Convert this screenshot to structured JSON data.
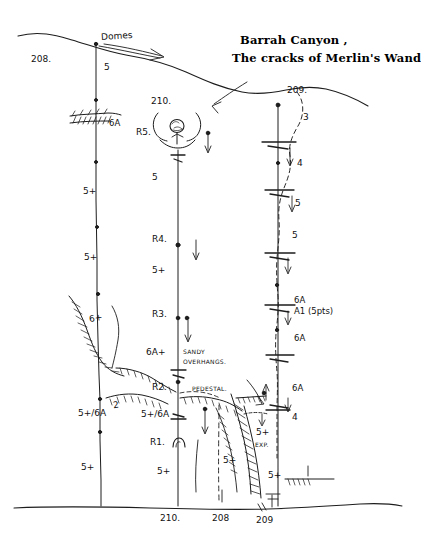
{
  "title": {
    "line1": "Barrah Canyon ,",
    "line2": "The cracks of Merlin's Wand"
  },
  "annotations": {
    "domes": "Domes",
    "sandy_overhangs_l1": "SANDY",
    "sandy_overhangs_l2": "OVERHANGS.",
    "pedestal": "PEDESTAL.",
    "exposed": "EXP.",
    "aid_points": "A1 (5pts)"
  },
  "routes": [
    {
      "id": "route-208",
      "top_label": "208.",
      "bottom_label": "208",
      "belays": [
        {
          "name": "6A-ledge",
          "label": "6A"
        }
      ],
      "pitch_grades": [
        "5",
        "5+",
        "5+",
        "6+",
        "2",
        "5+/6A",
        "5+"
      ]
    },
    {
      "id": "route-210",
      "top_label": "210.",
      "bottom_label": "210.",
      "belays": [
        {
          "name": "R5",
          "label": "R5."
        },
        {
          "name": "R4",
          "label": "R4."
        },
        {
          "name": "R3",
          "label": "R3."
        },
        {
          "name": "R2",
          "label": "R2."
        },
        {
          "name": "R1",
          "label": "R1."
        }
      ],
      "pitch_grades": [
        "5",
        "5+",
        "6A+",
        "5+/6A",
        "5+"
      ]
    },
    {
      "id": "route-209",
      "top_label": "209.",
      "bottom_label": "209",
      "pitch_grades": [
        "3",
        "4",
        "5",
        "5",
        "6A",
        "6A",
        "6A",
        "4",
        "5+",
        "5+"
      ]
    }
  ],
  "grade_marks": {
    "left": {
      "p1": "5",
      "anchor_6a": "6A",
      "p2": "5+",
      "p3": "5+",
      "p4": "6+",
      "p5": "2",
      "p6": "5+/6A",
      "p7": "5+"
    },
    "mid": {
      "r5": "R5.",
      "p1": "5",
      "r4": "R4.",
      "p2": "5+",
      "r3": "R3.",
      "p3": "6A+",
      "r2": "R2.",
      "p4": "5+/6A",
      "r1": "R1.",
      "p5": "5+"
    },
    "right": {
      "p1": "3",
      "p2": "4",
      "p3": "5",
      "p4": "5",
      "p5": "6A",
      "aid": "A1 (5pts)",
      "p6": "6A",
      "p7": "6A",
      "p8": "4",
      "p9": "5+",
      "p10": "5+"
    }
  },
  "labels": {
    "top_208": "208.",
    "top_210": "210.",
    "top_209": "209.",
    "bottom_210": "210.",
    "bottom_208": "208",
    "bottom_209": "209"
  },
  "colors": {
    "ink": "#1a1a1a",
    "paper": "#ffffff"
  }
}
